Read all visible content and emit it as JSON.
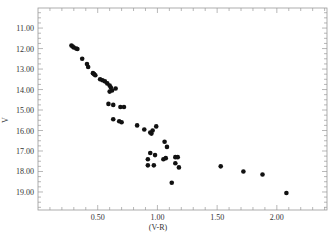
{
  "chart_data": {
    "type": "scatter",
    "title": "",
    "xlabel": "(V-R)",
    "ylabel": "V",
    "xlim": [
      0.0,
      2.42
    ],
    "ylim": [
      19.9,
      10.0
    ],
    "y_inverted": true,
    "grid": false,
    "legend": null,
    "x_ticks": [
      {
        "value": 0.5,
        "label": "0.50"
      },
      {
        "value": 1.0,
        "label": "1.00"
      },
      {
        "value": 1.5,
        "label": "1.50"
      },
      {
        "value": 2.0,
        "label": "2.00"
      }
    ],
    "y_ticks": [
      {
        "value": 11,
        "label": "11.00"
      },
      {
        "value": 12,
        "label": "12.00"
      },
      {
        "value": 13,
        "label": "13.00"
      },
      {
        "value": 14,
        "label": "14.00"
      },
      {
        "value": 15,
        "label": "15.00"
      },
      {
        "value": 16,
        "label": "16.00"
      },
      {
        "value": 17,
        "label": "17.00"
      },
      {
        "value": 18,
        "label": "18.00"
      },
      {
        "value": 19,
        "label": "19.00"
      }
    ],
    "marker_color": "#111111",
    "series": [
      {
        "name": "stars",
        "points": [
          {
            "x": 0.28,
            "y": 11.85
          },
          {
            "x": 0.29,
            "y": 11.9
          },
          {
            "x": 0.3,
            "y": 11.95
          },
          {
            "x": 0.32,
            "y": 12.0
          },
          {
            "x": 0.33,
            "y": 12.02
          },
          {
            "x": 0.37,
            "y": 12.5
          },
          {
            "x": 0.41,
            "y": 12.75
          },
          {
            "x": 0.42,
            "y": 12.9
          },
          {
            "x": 0.46,
            "y": 13.2
          },
          {
            "x": 0.47,
            "y": 13.25
          },
          {
            "x": 0.48,
            "y": 13.3
          },
          {
            "x": 0.52,
            "y": 13.5
          },
          {
            "x": 0.54,
            "y": 13.55
          },
          {
            "x": 0.56,
            "y": 13.6
          },
          {
            "x": 0.58,
            "y": 13.7
          },
          {
            "x": 0.6,
            "y": 13.8
          },
          {
            "x": 0.61,
            "y": 13.9
          },
          {
            "x": 0.62,
            "y": 14.05
          },
          {
            "x": 0.6,
            "y": 14.1
          },
          {
            "x": 0.65,
            "y": 13.95
          },
          {
            "x": 0.59,
            "y": 14.7
          },
          {
            "x": 0.63,
            "y": 14.75
          },
          {
            "x": 0.69,
            "y": 14.85
          },
          {
            "x": 0.72,
            "y": 14.85
          },
          {
            "x": 0.63,
            "y": 15.45
          },
          {
            "x": 0.68,
            "y": 15.55
          },
          {
            "x": 0.7,
            "y": 15.6
          },
          {
            "x": 0.83,
            "y": 15.75
          },
          {
            "x": 0.89,
            "y": 15.95
          },
          {
            "x": 0.94,
            "y": 16.1
          },
          {
            "x": 0.96,
            "y": 16.0
          },
          {
            "x": 0.99,
            "y": 15.8
          },
          {
            "x": 0.95,
            "y": 16.15
          },
          {
            "x": 1.06,
            "y": 16.55
          },
          {
            "x": 1.08,
            "y": 16.8
          },
          {
            "x": 0.94,
            "y": 17.1
          },
          {
            "x": 0.92,
            "y": 17.4
          },
          {
            "x": 0.98,
            "y": 17.2
          },
          {
            "x": 1.07,
            "y": 17.35
          },
          {
            "x": 1.05,
            "y": 17.4
          },
          {
            "x": 0.92,
            "y": 17.7
          },
          {
            "x": 0.97,
            "y": 17.7
          },
          {
            "x": 1.15,
            "y": 17.3
          },
          {
            "x": 1.17,
            "y": 17.3
          },
          {
            "x": 1.15,
            "y": 17.6
          },
          {
            "x": 1.18,
            "y": 17.8
          },
          {
            "x": 1.12,
            "y": 18.55
          },
          {
            "x": 1.53,
            "y": 17.75
          },
          {
            "x": 1.72,
            "y": 18.0
          },
          {
            "x": 1.88,
            "y": 18.15
          },
          {
            "x": 2.08,
            "y": 19.05
          }
        ]
      }
    ]
  }
}
